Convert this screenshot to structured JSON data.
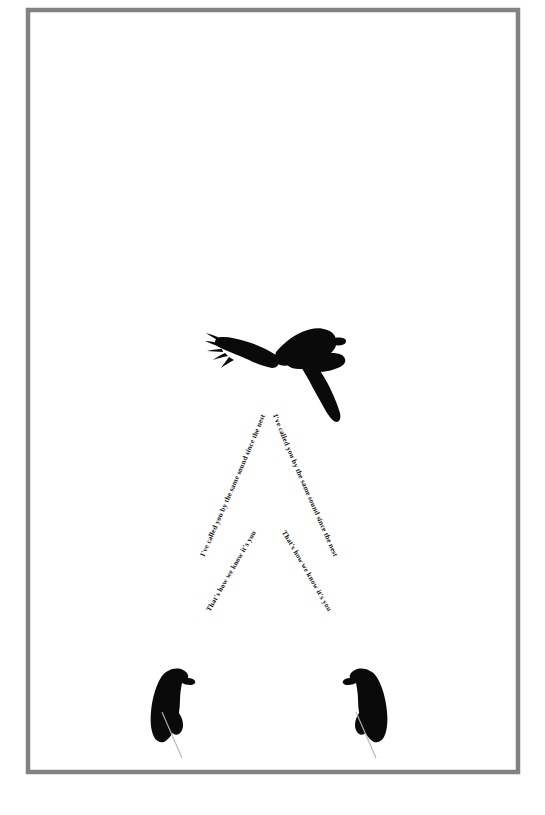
{
  "artwork": {
    "title": "Raven Calligram",
    "background_color": "#ffffff",
    "frame": {
      "name": "poster-border",
      "color": "#828282",
      "thickness_px": 4.5,
      "x": 28,
      "y": 10,
      "width": 490,
      "height": 762
    },
    "ink_color": "#0a0a0a",
    "tail_color": "#b4b4b4"
  },
  "text_paths": {
    "outer_right": {
      "name": "text-outer-right",
      "content": "I've called you by the same sound since the nest"
    },
    "outer_left": {
      "name": "text-outer-left",
      "content": "I've called you by the same sound since the nest"
    },
    "inner_right": {
      "name": "text-inner-right",
      "content": "That's how we know it's you"
    },
    "inner_left": {
      "name": "text-inner-left",
      "content": "That's how we know it's you"
    }
  },
  "birds": {
    "flying": {
      "name": "flying-raven",
      "label": "raven in flight",
      "center_x": 277,
      "center_y": 375
    },
    "perched_left": {
      "name": "perched-crow-left",
      "label": "perched crow facing right",
      "center_x": 167,
      "center_y": 700
    },
    "perched_right": {
      "name": "perched-crow-right",
      "label": "perched crow facing left",
      "center_x": 371,
      "center_y": 700
    }
  }
}
